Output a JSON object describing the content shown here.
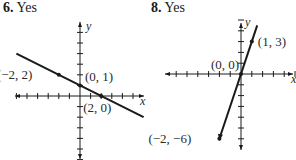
{
  "problems": [
    {
      "number": "6.",
      "answer": "Yes",
      "graph": {
        "x_axis_label": "x",
        "y_axis_label": "y",
        "x_ticks": [
          -6,
          -5,
          -4,
          -3,
          -2,
          -1,
          1,
          2,
          3,
          4,
          5
        ],
        "y_ticks": [
          -6,
          -5,
          -4,
          -3,
          -2,
          -1,
          1,
          2,
          3,
          4,
          5,
          6
        ],
        "line": {
          "slope": -0.5,
          "intercept": 1,
          "x_range": [
            -6,
            6
          ]
        },
        "points": [
          {
            "x": -2,
            "y": 2,
            "label": "(−2, 2)"
          },
          {
            "x": 0,
            "y": 1,
            "label": "(0, 1)"
          },
          {
            "x": 2,
            "y": 0,
            "label": "(2, 0)"
          }
        ]
      }
    },
    {
      "number": "8.",
      "answer": "Yes",
      "graph": {
        "x_axis_label": "x",
        "y_axis_label": "y",
        "x_ticks": [
          -6,
          -5,
          -4,
          -3,
          -2,
          -1,
          1,
          2,
          3,
          4,
          5
        ],
        "y_ticks": [
          -6,
          -5,
          -4,
          -3,
          -2,
          -1,
          1,
          2,
          3,
          4,
          5
        ],
        "line": {
          "slope": 3,
          "intercept": 0,
          "x_range": [
            -2,
            1.5
          ]
        },
        "points": [
          {
            "x": 1,
            "y": 3,
            "label": "(1, 3)"
          },
          {
            "x": 0,
            "y": 0,
            "label": "(0, 0)"
          },
          {
            "x": -2,
            "y": -6,
            "label": "(−2, −6)"
          }
        ]
      }
    }
  ]
}
